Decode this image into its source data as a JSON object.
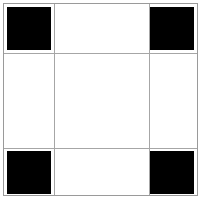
{
  "figure": {
    "title": "",
    "background_color": "#ffffff",
    "border_color": "#9a9a9a",
    "gridline_color": "#a6a6a6",
    "marker_color": "#000000",
    "width": 203,
    "height": 201
  },
  "chart_data": {
    "type": "heatmap",
    "title": "",
    "subtitle": "",
    "xlabel": "",
    "ylabel": "",
    "grid": true,
    "legend": "none",
    "rows": 3,
    "cols": 3,
    "x": [
      0,
      1,
      2
    ],
    "y": [
      0,
      1,
      2
    ],
    "categories": [
      "col-0",
      "col-1",
      "col-2"
    ],
    "row_labels": [
      "row-0",
      "row-1",
      "row-2"
    ],
    "tick_labels_x": [
      "",
      "",
      ""
    ],
    "tick_labels_y": [
      "",
      "",
      ""
    ],
    "values": [
      [
        1,
        0,
        1
      ],
      [
        0,
        0,
        0
      ],
      [
        1,
        0,
        1
      ]
    ],
    "value_colors": {
      "0": "#ffffff",
      "1": "#000000"
    },
    "zlim": [
      0,
      1
    ],
    "annotations": []
  },
  "grid": {
    "cells": [
      {
        "id": "cell-r0c0",
        "row": 0,
        "col": 0,
        "state": "filled",
        "value": 1
      },
      {
        "id": "cell-r0c1",
        "row": 0,
        "col": 1,
        "state": "empty",
        "value": 0
      },
      {
        "id": "cell-r0c2",
        "row": 0,
        "col": 2,
        "state": "filled",
        "value": 1
      },
      {
        "id": "cell-r1c0",
        "row": 1,
        "col": 0,
        "state": "empty",
        "value": 0
      },
      {
        "id": "cell-r1c1",
        "row": 1,
        "col": 1,
        "state": "empty",
        "value": 0
      },
      {
        "id": "cell-r1c2",
        "row": 1,
        "col": 2,
        "state": "empty",
        "value": 0
      },
      {
        "id": "cell-r2c0",
        "row": 2,
        "col": 0,
        "state": "filled",
        "value": 1
      },
      {
        "id": "cell-r2c1",
        "row": 2,
        "col": 1,
        "state": "empty",
        "value": 0
      },
      {
        "id": "cell-r2c2",
        "row": 2,
        "col": 2,
        "state": "filled",
        "value": 1
      }
    ],
    "gridlines": {
      "vertical": [
        50,
        145
      ],
      "horizontal": [
        49,
        144
      ]
    }
  }
}
